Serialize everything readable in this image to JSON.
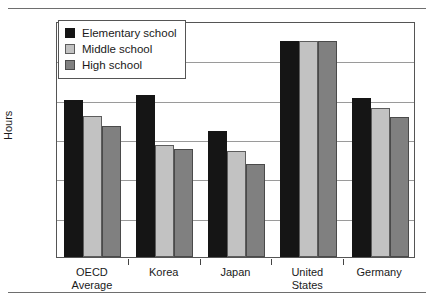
{
  "chart_data": {
    "type": "bar",
    "title": "",
    "xlabel": "",
    "ylabel": "Hours",
    "ylim": [
      0,
      1200
    ],
    "yticks": [
      0,
      200,
      400,
      600,
      800,
      1000,
      1200
    ],
    "ytick_labels": [
      "0",
      "200",
      "400",
      "600",
      "800",
      "1000",
      "1200"
    ],
    "grid": true,
    "legend_position": "top-left",
    "categories": [
      "OECD\nAverage",
      "Korea",
      "Japan",
      "United\nStates",
      "Germany"
    ],
    "series": [
      {
        "name": "Elementary school",
        "color": "#151515",
        "values": [
          800,
          825,
          640,
          1100,
          810
        ]
      },
      {
        "name": "Middle school",
        "color": "#c2c2c2",
        "values": [
          715,
          570,
          540,
          1100,
          760
        ]
      },
      {
        "name": "High school",
        "color": "#808080",
        "values": [
          665,
          550,
          475,
          1100,
          710
        ]
      }
    ]
  }
}
